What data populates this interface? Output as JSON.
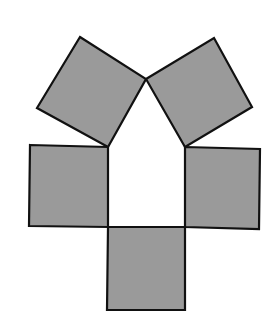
{
  "diagram": {
    "fill_color": "#9a9a9a",
    "stroke_color": "#111111",
    "background": "#ffffff",
    "shapes": [
      {
        "name": "top-left-tilted-square",
        "points": "80,37 146,79 108,147 37,108"
      },
      {
        "name": "top-right-tilted-square",
        "points": "146,79 214,38 252,107 185,147"
      },
      {
        "name": "middle-left-square",
        "points": "30,145 108,147 108,227 29,226"
      },
      {
        "name": "middle-right-square",
        "points": "185,147 260,149 259,229 185,227"
      },
      {
        "name": "bottom-square",
        "points": "108,227 185,227 185,310 107,310"
      }
    ],
    "center_region": {
      "name": "pentagon",
      "points": "146,79 185,147 185,227 108,227 108,147"
    }
  }
}
